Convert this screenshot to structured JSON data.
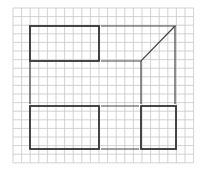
{
  "figure": {
    "width": 200,
    "height": 171,
    "background": "#ffffff",
    "grid": {
      "x0": 13,
      "y0": 8,
      "cols": 21,
      "rows": 18,
      "cell": 8.6,
      "color": "#c8c8c8"
    },
    "shapes": [
      {
        "id": "top-left-rectangle",
        "type": "rect",
        "x": 30,
        "y": 26,
        "w": 69,
        "h": 35,
        "style": "bold"
      },
      {
        "id": "bottom-left-rectangle",
        "type": "rect",
        "x": 30,
        "y": 106,
        "w": 69,
        "h": 43,
        "style": "bold"
      },
      {
        "id": "bottom-right-rectangle",
        "type": "rect",
        "x": 141,
        "y": 106,
        "w": 35,
        "h": 43,
        "style": "bold"
      },
      {
        "id": "top-right-trapezoid",
        "type": "polyline",
        "points": [
          [
            101,
            26
          ],
          [
            175,
            26
          ],
          [
            141,
            61
          ],
          [
            101,
            61
          ]
        ],
        "style": "thin"
      },
      {
        "id": "right-vertical-outer",
        "type": "line",
        "points": [
          [
            175,
            26
          ],
          [
            175,
            104
          ]
        ],
        "style": "thin"
      },
      {
        "id": "right-vertical-inner",
        "type": "line",
        "points": [
          [
            141,
            61
          ],
          [
            141,
            104
          ]
        ],
        "style": "thin"
      },
      {
        "id": "left-vertical-connector",
        "type": "line",
        "points": [
          [
            30,
            61
          ],
          [
            30,
            104
          ]
        ],
        "style": "thin"
      },
      {
        "id": "middle-top-connector",
        "type": "line",
        "points": [
          [
            101,
            106
          ],
          [
            139,
            106
          ]
        ],
        "style": "thin"
      },
      {
        "id": "middle-bottom-connector",
        "type": "line",
        "points": [
          [
            101,
            149
          ],
          [
            139,
            149
          ]
        ],
        "style": "thin"
      }
    ],
    "line_color": "#333333"
  }
}
